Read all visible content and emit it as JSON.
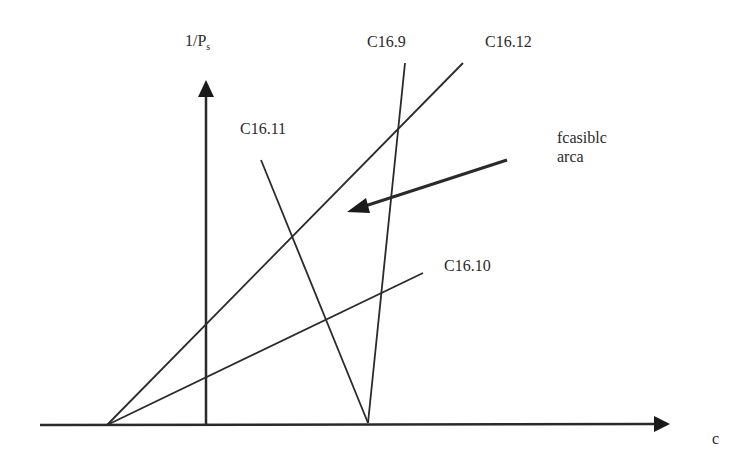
{
  "diagram": {
    "type": "feasibility-region-diagram",
    "axes": {
      "x_label": "c",
      "y_label_main": "1/P",
      "y_label_sub": "s"
    },
    "constraints": [
      {
        "id": "C16.9",
        "label": "C16.9"
      },
      {
        "id": "C16.10",
        "label": "C16.10"
      },
      {
        "id": "C16.11",
        "label": "C16.11"
      },
      {
        "id": "C16.12",
        "label": "C16.12"
      }
    ],
    "annotation": {
      "line1": "fcasiblc",
      "line2": "arca"
    },
    "colors": {
      "line": "#2a2a2a",
      "background": "#ffffff"
    }
  }
}
